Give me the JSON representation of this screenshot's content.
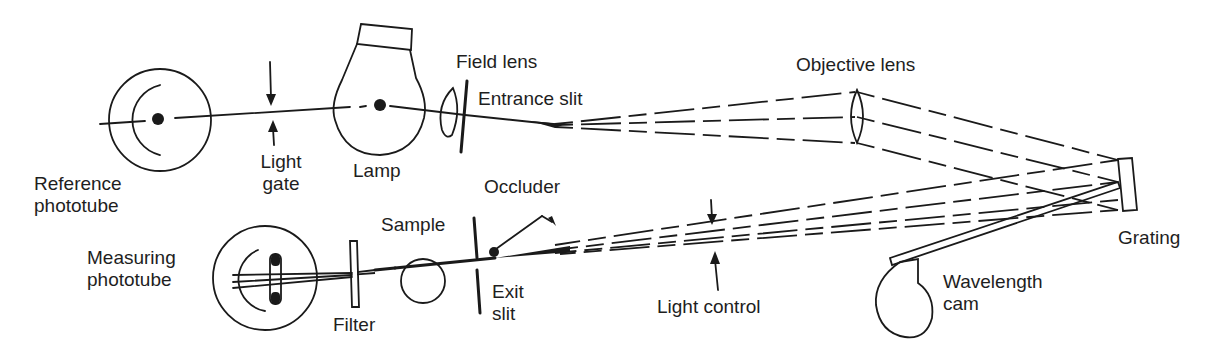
{
  "diagram": {
    "labels": {
      "reference_phototube": [
        "Reference",
        "phototube"
      ],
      "light_gate": [
        "Light",
        "gate"
      ],
      "lamp": "Lamp",
      "field_lens": "Field lens",
      "entrance_slit": "Entrance slit",
      "objective_lens": "Objective lens",
      "grating": "Grating",
      "measuring_phototube": [
        "Measuring",
        "phototube"
      ],
      "filter": "Filter",
      "sample": "Sample",
      "occluder": "Occluder",
      "exit_slit": [
        "Exit",
        "slit"
      ],
      "light_control": "Light control",
      "wavelength_cam": [
        "Wavelength",
        "cam"
      ]
    },
    "colors": {
      "ink": "#1a1a1a",
      "background": "#ffffff"
    }
  }
}
